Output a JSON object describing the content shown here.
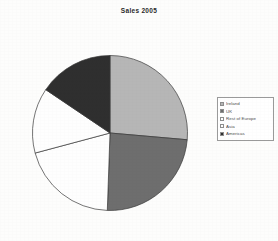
{
  "chart_data": {
    "type": "pie",
    "title": "Sales 2005",
    "xlabel": "",
    "ylabel": "",
    "grid": false,
    "legend_position": "right",
    "categories": [
      "Ireland",
      "UK",
      "Rest of Europe",
      "Asia",
      "Americas"
    ],
    "values": [
      26.4,
      24.2,
      20.3,
      13.6,
      15.5
    ],
    "start_angle_deg": 0,
    "direction": "clockwise",
    "slice_angles_deg": [
      95,
      87,
      73,
      49,
      56
    ],
    "colors": [
      "#b6b6b6",
      "#6e6e6e",
      "#fefefe",
      "#fefefe",
      "#2f2f2f"
    ],
    "stroke_color": "#3a3a3a",
    "series": [
      {
        "name": "Sales 2005",
        "values": [
          26.4,
          24.2,
          20.3,
          13.6,
          15.5
        ]
      }
    ]
  },
  "chart": {
    "title": "Sales 2005",
    "legend": {
      "items": [
        {
          "label": "Ireland",
          "color": "#b6b6b6"
        },
        {
          "label": "UK",
          "color": "#6e6e6e"
        },
        {
          "label": "Rest of Europe",
          "color": "#fefefe"
        },
        {
          "label": "Asia",
          "color": "#fefefe"
        },
        {
          "label": "Americas",
          "color": "#2f2f2f"
        }
      ]
    }
  }
}
